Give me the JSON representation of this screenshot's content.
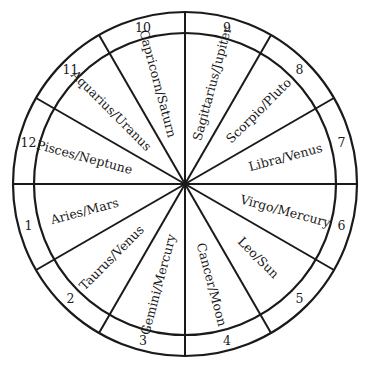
{
  "diagram": {
    "type": "astrological-house-wheel",
    "center": [
      185,
      184
    ],
    "outer_radius": 172,
    "inner_radius": 151,
    "label_radius": 104,
    "number_radius": 162,
    "line_color": "#1a1a1a",
    "background": "#ffffff",
    "houses": [
      {
        "number": "1",
        "label": "Aries/Mars",
        "mid_angle": 195
      },
      {
        "number": "2",
        "label": "Taurus/Venus",
        "mid_angle": 225
      },
      {
        "number": "3",
        "label": "Gemini/Mercury",
        "mid_angle": 255
      },
      {
        "number": "4",
        "label": "Cancer/Moon",
        "mid_angle": 285
      },
      {
        "number": "5",
        "label": "Leo/Sun",
        "mid_angle": 315
      },
      {
        "number": "6",
        "label": "Virgo/Mercury",
        "mid_angle": 345
      },
      {
        "number": "7",
        "label": "Libra/Venus",
        "mid_angle": 15
      },
      {
        "number": "8",
        "label": "Scorpio/Pluto",
        "mid_angle": 45
      },
      {
        "number": "9",
        "label": "Sagittarius/Jupiter",
        "mid_angle": 75
      },
      {
        "number": "10",
        "label": "Capricorn/Saturn",
        "mid_angle": 105
      },
      {
        "number": "11",
        "label": "Aquarius/Uranus",
        "mid_angle": 135
      },
      {
        "number": "12",
        "label": "Pisces/Neptune",
        "mid_angle": 165
      }
    ]
  }
}
